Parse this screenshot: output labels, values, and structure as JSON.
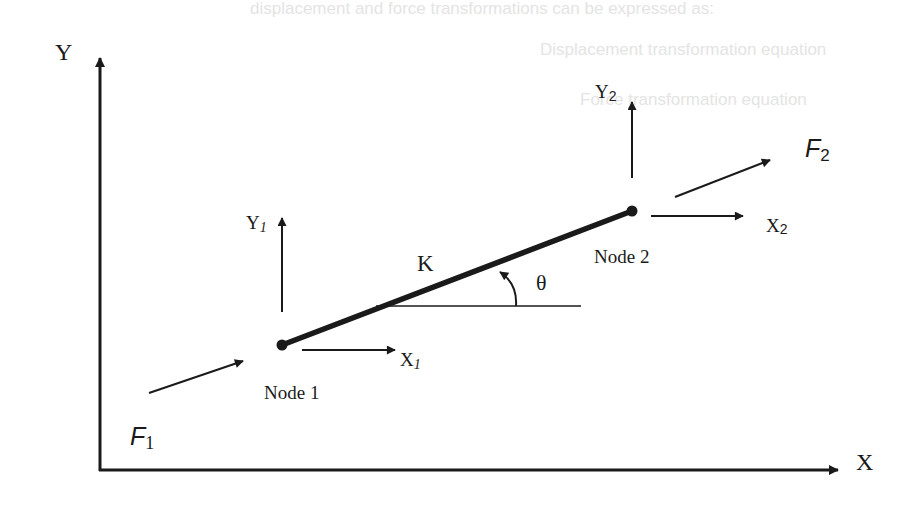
{
  "figure": {
    "colors": {
      "ink": "#1a1a1a",
      "background": "#ffffff",
      "bleed_through_text": "#e4e4e4"
    }
  },
  "axes": {
    "x_label": "X",
    "y_label": "Y"
  },
  "element": {
    "stiffness_label": "K",
    "angle_label": "θ"
  },
  "nodes": [
    {
      "label": "Node 1",
      "dof_x": {
        "base": "X",
        "sub": "1"
      },
      "dof_y": {
        "base": "Y",
        "sub": "1"
      },
      "force": {
        "base": "F",
        "sub": "1"
      }
    },
    {
      "label": "Node 2",
      "dof_x": {
        "base": "X",
        "sub": "2"
      },
      "dof_y": {
        "base": "Y",
        "sub": "2"
      },
      "force": {
        "base": "F",
        "sub": "2"
      }
    }
  ],
  "background_bleed_text": [
    "displacement and force transformations can be expressed as:",
    "Displacement transformation equation",
    "Force transformation equation"
  ]
}
